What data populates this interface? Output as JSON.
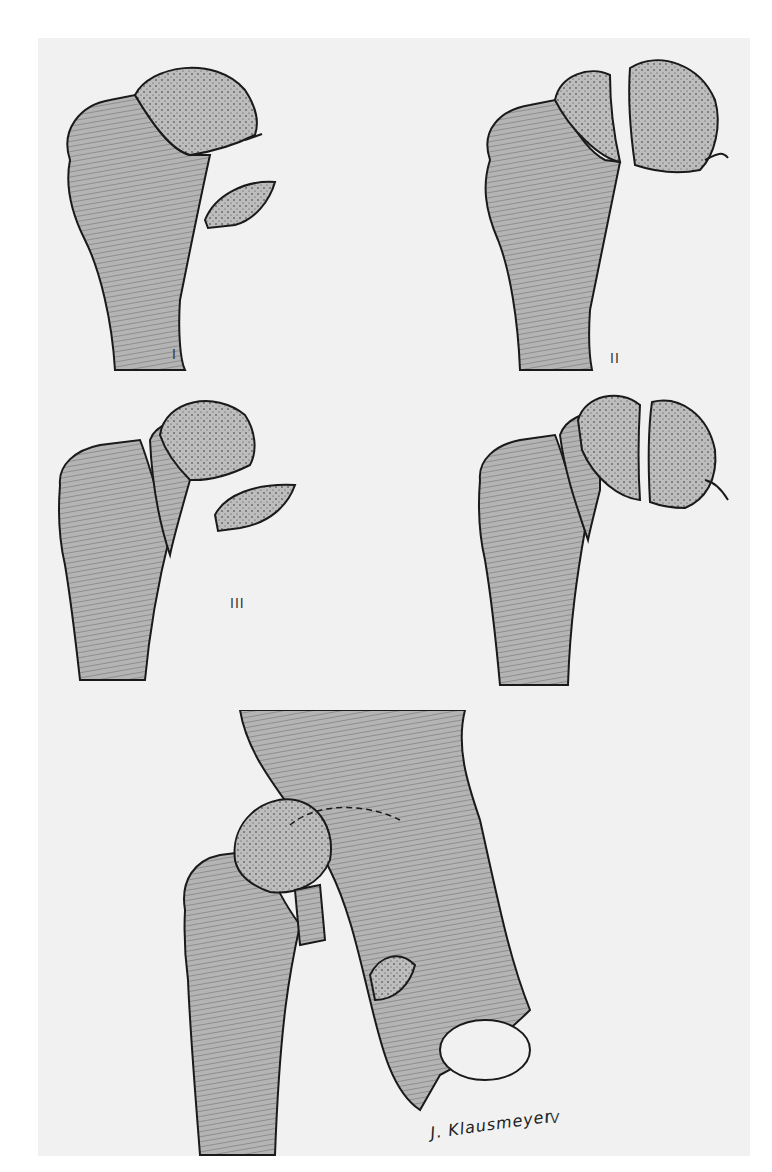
{
  "figure": {
    "panels": [
      {
        "id": "I",
        "label": "I",
        "description": "Femoral head fracture fragment below fovea, separated fragment"
      },
      {
        "id": "II",
        "label": "II",
        "description": "Femoral head split fracture above fovea with ligamentum teres"
      },
      {
        "id": "III",
        "label": "III",
        "description": "Type I fracture with associated femoral neck fracture"
      },
      {
        "id": "IV",
        "label": "IV",
        "description": "Femoral head split with femoral neck fracture and ligament attachment"
      },
      {
        "id": "V",
        "label": "IV",
        "description": "Femoral head fracture with associated acetabular fracture shown with pelvis"
      }
    ],
    "signature": "J. Klausmeyer",
    "colors": {
      "bone_fill": "#b9b9b9",
      "outline": "#1a1a1a",
      "background": "#f1f1f1",
      "paper": "#ffffff"
    }
  }
}
